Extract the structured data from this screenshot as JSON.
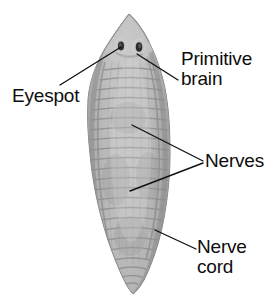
{
  "figure": {
    "background_color": "#ffffff",
    "text_color": "#0d0d0d",
    "leader_line_color": "#111111",
    "body_colors": {
      "outline": "#8e8e8e",
      "body_light": "#c9c9c9",
      "body_mid": "#a8a8a8",
      "body_dark": "#8a8a8a",
      "nerve_band": "#9a9a9a",
      "eyespot": "#2b2b2b",
      "highlight": "#d8d8d8"
    }
  },
  "labels": {
    "eyespot": "Eyespot",
    "primitive_brain": "Primitive\nbrain",
    "nerves": "Nerves",
    "nerve_cord": "Nerve\ncord"
  },
  "icons": {
    "eyespot_left": "eyespot-icon",
    "eyespot_right": "eyespot-icon",
    "worm_body": "flatworm-body-icon"
  },
  "leader_lines": {
    "eyespot": {
      "x1": 60,
      "y1": 85,
      "x2": 121,
      "y2": 47
    },
    "primitive_brain": {
      "x1": 137,
      "y1": 54,
      "x2": 178,
      "y2": 80
    },
    "nerves_upper": {
      "x1": 132,
      "y1": 125,
      "x2": 203,
      "y2": 161
    },
    "nerves_lower": {
      "x1": 130,
      "y1": 191,
      "x2": 203,
      "y2": 163
    },
    "nerve_cord": {
      "x1": 155,
      "y1": 230,
      "x2": 196,
      "y2": 249
    }
  }
}
